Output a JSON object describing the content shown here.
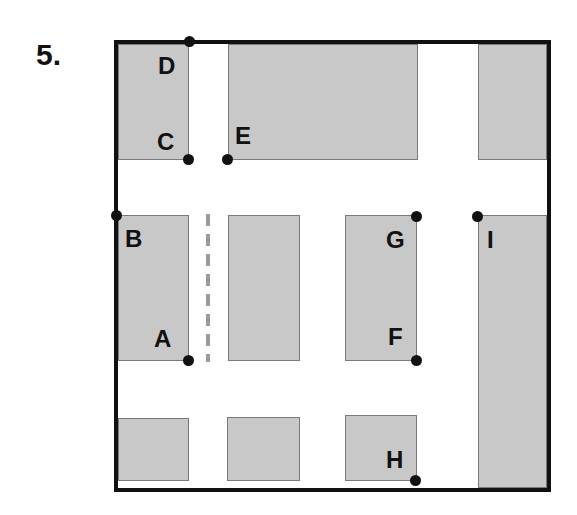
{
  "problem_number": "5.",
  "colors": {
    "block": "#c8c8c8",
    "outline": "#111111",
    "dash": "#9a9a9a"
  },
  "points": [
    {
      "label": "A",
      "x": 188,
      "y": 360
    },
    {
      "label": "B",
      "x": 116,
      "y": 215
    },
    {
      "label": "C",
      "x": 188,
      "y": 159
    },
    {
      "label": "D",
      "x": 189,
      "y": 41
    },
    {
      "label": "E",
      "x": 227,
      "y": 159
    },
    {
      "label": "F",
      "x": 416,
      "y": 360
    },
    {
      "label": "G",
      "x": 416,
      "y": 216
    },
    {
      "label": "H",
      "x": 415,
      "y": 480
    },
    {
      "label": "I",
      "x": 477,
      "y": 216
    }
  ]
}
